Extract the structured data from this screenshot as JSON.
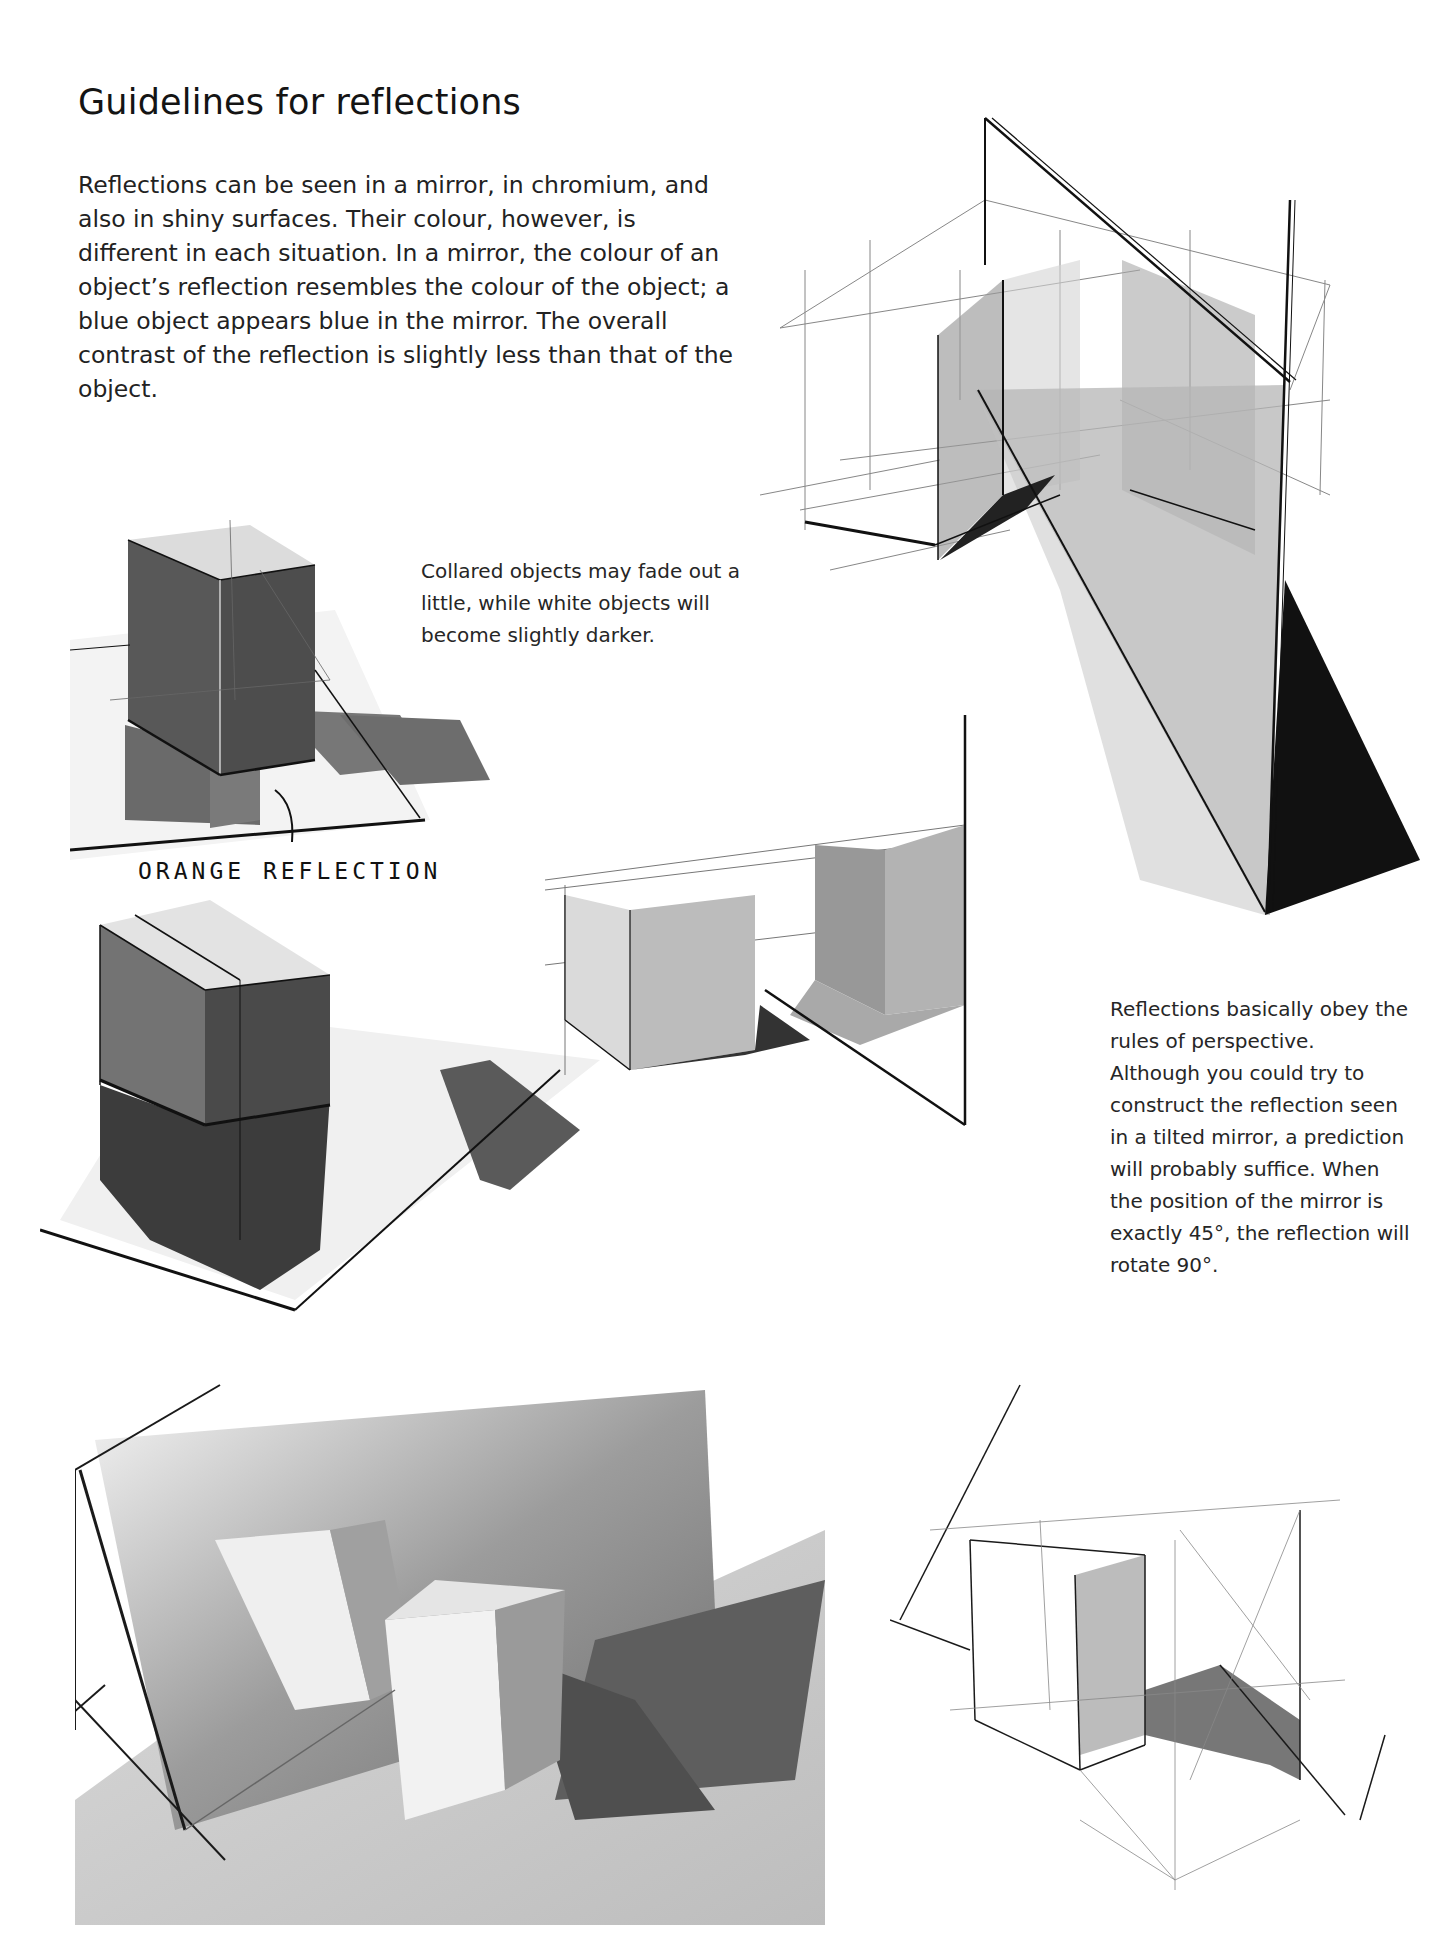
{
  "page": {
    "title": "Guidelines for reflections",
    "intro_paragraph": "Reflections can be seen in a mirror, in chromium, and also in shiny surfaces. Their colour, however, is different in each situation. In a mirror, the colour of an object’s reflection resembles the colour of the object; a blue object appears blue in the mirror. The overall contrast of the reflection is slightly less than that of the object."
  },
  "captions": {
    "collared_objects": "Collared objects may fade out a little, while white objects will become slightly darker.",
    "perspective_rules": "Reflections basically obey the rules of perspective. Although you could try to construct the reflection seen in a tilted mirror, a prediction will probably suffice. When the position of the mirror is exactly 45°, the reflection will rotate 90°."
  },
  "annotations": {
    "orange_reflection_label": "ORANGE REFLECTION"
  },
  "figures": [
    {
      "id": "tilted-mirror-sketch",
      "description": "Perspective construction of a block reflected in a tilted mirror"
    },
    {
      "id": "orange-block-sketch",
      "description": "Dark block standing on a mirror with its reflection"
    },
    {
      "id": "split-block-sketch",
      "description": "Two-part block reflected in a floor mirror"
    },
    {
      "id": "vertical-mirror-sketch",
      "description": "Block reflected in an upright mirror"
    },
    {
      "id": "mirror-photo",
      "description": "Photograph of a white box in front of a tilted mirror"
    },
    {
      "id": "construction-sketch",
      "description": "Line construction of a reflection at a mirror edge"
    }
  ],
  "colors": {
    "ink": "#141414",
    "marker_dark": "#3a3a3a",
    "marker_mid": "#8a8a8a",
    "marker_light": "#c9c9c9",
    "paper": "#ffffff"
  }
}
